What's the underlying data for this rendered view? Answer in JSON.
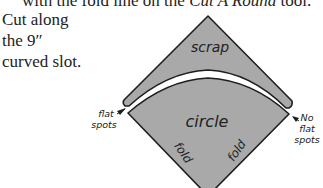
{
  "header_text": {
    "prefix": "with the fold line on the ",
    "tool_name": "Cut A Round",
    "suffix": " tool."
  },
  "instruction": {
    "lines": [
      "Cut along",
      "the 9″",
      "curved slot."
    ]
  },
  "diagram": {
    "labels": {
      "scrap": "scrap",
      "circle": "circle",
      "fold_left": "fold",
      "fold_right": "fold",
      "flat_spots_line1": "flat",
      "flat_spots_line2": "spots",
      "no_flat_line1": "No",
      "no_flat_line2": "flat",
      "no_flat_line3": "spots"
    },
    "colors": {
      "fabric_fill": "#a9a9a9",
      "outline": "#1e1e1e"
    }
  }
}
